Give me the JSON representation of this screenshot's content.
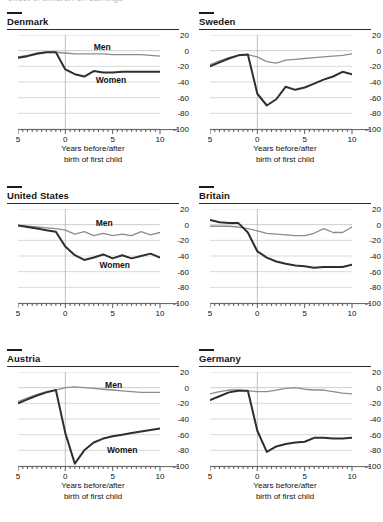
{
  "ghost_strip": "effect of children on earnings",
  "axis": {
    "y_ticks": [
      "20",
      "0",
      "-20",
      "-40",
      "-60",
      "-80",
      "-100"
    ],
    "x_ticks": [
      "5",
      "0",
      "5",
      "10"
    ],
    "caption_line1": "Years before/after",
    "caption_line2": "birth of first child"
  },
  "labels": {
    "men": "Men",
    "women": "Women"
  },
  "colors": {
    "women_line": "#2f2f2f",
    "men_line": "#8c8c8c",
    "grid": "#c8c8c8",
    "zero_rule": "#b0b0b0",
    "text": "#151515"
  },
  "chart_data": {
    "type": "line",
    "title": "Effect of children on earnings",
    "xlabel": "Years before/after birth of first child",
    "ylabel": "",
    "xlim": [
      -5,
      10
    ],
    "ylim": [
      -100,
      20
    ],
    "grid": true,
    "legend": "inline",
    "x": [
      -5,
      -4,
      -3,
      -2,
      -1,
      0,
      1,
      2,
      3,
      4,
      5,
      6,
      7,
      8,
      9,
      10
    ],
    "panels": [
      {
        "name": "Denmark",
        "show_labels": true,
        "men_label_x": 3.0,
        "men_label_y": 5,
        "women_label_x": 3.2,
        "women_label_y": -37,
        "series": [
          {
            "name": "Men",
            "values": [
              -8,
              -6,
              -3,
              -2,
              -2,
              -3,
              -4,
              -4,
              -4,
              -4,
              -5,
              -5,
              -5,
              -5,
              -6,
              -7
            ]
          },
          {
            "name": "Women",
            "values": [
              -9,
              -7,
              -4,
              -2,
              -2,
              -24,
              -30,
              -33,
              -26,
              -28,
              -28,
              -27,
              -27,
              -27,
              -27,
              -27
            ]
          }
        ]
      },
      {
        "name": "Sweden",
        "show_labels": false,
        "series": [
          {
            "name": "Men",
            "values": [
              -18,
              -13,
              -9,
              -6,
              -5,
              -8,
              -14,
              -16,
              -12,
              -11,
              -10,
              -9,
              -8,
              -7,
              -6,
              -4
            ]
          },
          {
            "name": "Women",
            "values": [
              -20,
              -15,
              -10,
              -6,
              -5,
              -55,
              -70,
              -62,
              -46,
              -50,
              -47,
              -42,
              -37,
              -33,
              -27,
              -30
            ]
          }
        ]
      },
      {
        "name": "United States",
        "show_labels": true,
        "men_label_x": 3.2,
        "men_label_y": 2,
        "women_label_x": 3.6,
        "women_label_y": -52,
        "series": [
          {
            "name": "Men",
            "values": [
              -1,
              -2,
              -3,
              -4,
              -5,
              -7,
              -12,
              -9,
              -14,
              -11,
              -14,
              -12,
              -14,
              -9,
              -13,
              -10
            ]
          },
          {
            "name": "Women",
            "values": [
              -1,
              -3,
              -5,
              -7,
              -9,
              -28,
              -39,
              -45,
              -42,
              -38,
              -43,
              -39,
              -43,
              -40,
              -37,
              -42
            ]
          }
        ]
      },
      {
        "name": "Britain",
        "show_labels": false,
        "series": [
          {
            "name": "Men",
            "values": [
              -2,
              -2,
              -2,
              -3,
              -5,
              -8,
              -11,
              -12,
              -13,
              -14,
              -14,
              -11,
              -5,
              -10,
              -10,
              -3
            ]
          },
          {
            "name": "Women",
            "values": [
              6,
              3,
              2,
              2,
              -10,
              -34,
              -42,
              -47,
              -50,
              -52,
              -53,
              -55,
              -54,
              -54,
              -54,
              -51
            ]
          }
        ]
      },
      {
        "name": "Austria",
        "show_labels": true,
        "men_label_x": 4.2,
        "men_label_y": 3,
        "women_label_x": 4.4,
        "women_label_y": -79,
        "series": [
          {
            "name": "Men",
            "values": [
              -18,
              -13,
              -9,
              -5,
              -3,
              0,
              1,
              0,
              -1,
              -2,
              -3,
              -4,
              -5,
              -6,
              -6,
              -6
            ]
          },
          {
            "name": "Women",
            "values": [
              -20,
              -15,
              -10,
              -6,
              -3,
              -58,
              -97,
              -80,
              -70,
              -65,
              -62,
              -60,
              -58,
              -56,
              -54,
              -52
            ]
          }
        ]
      },
      {
        "name": "Germany",
        "show_labels": false,
        "series": [
          {
            "name": "Men",
            "values": [
              -8,
              -5,
              -3,
              -3,
              -4,
              -5,
              -5,
              -3,
              -1,
              0,
              -2,
              -3,
              -3,
              -5,
              -7,
              -8
            ]
          },
          {
            "name": "Women",
            "values": [
              -16,
              -11,
              -6,
              -4,
              -4,
              -55,
              -82,
              -75,
              -72,
              -70,
              -69,
              -64,
              -64,
              -65,
              -65,
              -64
            ]
          }
        ]
      }
    ]
  }
}
